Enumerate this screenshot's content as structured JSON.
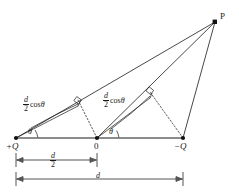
{
  "figure": {
    "colors": {
      "stroke": "#1a1a1a",
      "axis": "#555555",
      "background": "#ffffff"
    },
    "points": [
      {
        "id": "plusQ",
        "label": "+Q",
        "x": 16,
        "y": 138
      },
      {
        "id": "origin",
        "label": "0",
        "x": 97,
        "y": 138
      },
      {
        "id": "minusQ",
        "label": "−Q",
        "x": 183,
        "y": 138
      },
      {
        "id": "P",
        "label": "P",
        "x": 215,
        "y": 22
      }
    ],
    "angles": [
      {
        "id": "theta-left",
        "label": "θ",
        "vertex": "plusQ"
      },
      {
        "id": "theta-mid",
        "label": "θ",
        "vertex": "origin"
      }
    ],
    "projections": [
      {
        "id": "proj-left",
        "numerator": "d",
        "denominator": "2",
        "func": "cos",
        "variable": "θ"
      },
      {
        "id": "proj-mid",
        "numerator": "d",
        "denominator": "2",
        "func": "cos",
        "variable": "θ"
      }
    ],
    "dimensions": [
      {
        "id": "dim-half",
        "numerator": "d",
        "denominator": "2",
        "from": "plusQ",
        "to": "origin"
      },
      {
        "id": "dim-full",
        "label": "d",
        "from": "plusQ",
        "to": "minusQ"
      }
    ]
  }
}
